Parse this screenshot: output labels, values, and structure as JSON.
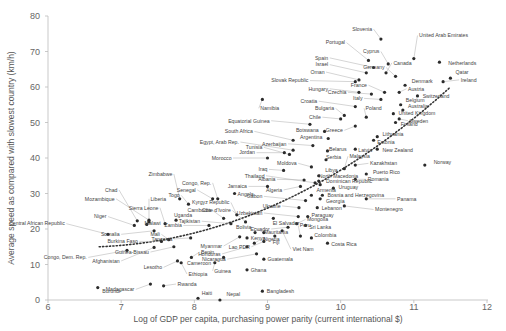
{
  "chart_data": {
    "type": "scatter",
    "title": "",
    "xlabel": "Log of GDP per capita, purchasing power parity (current international $)",
    "ylabel": "Average speed as compared with slowest country (km/h)",
    "xlim": [
      6,
      12
    ],
    "ylim": [
      0,
      80
    ],
    "xticks": [
      "6",
      "7",
      "8",
      "9",
      "10",
      "11",
      "12"
    ],
    "yticks": [
      "0",
      "10",
      "20",
      "30",
      "40",
      "50",
      "60",
      "70",
      "80"
    ],
    "grid": false,
    "legend": null,
    "trendline": {
      "style": "dotted",
      "points": [
        [
          6.7,
          15
        ],
        [
          9.2,
          23
        ],
        [
          11.5,
          60
        ]
      ]
    },
    "points": [
      {
        "label": "Burundi",
        "x": 6.68,
        "y": 3.5,
        "lx": 6.72,
        "ly": 2.4
      },
      {
        "label": "Central African Republic",
        "x": 6.82,
        "y": 18.5,
        "lx": 6.25,
        "ly": 21.5
      },
      {
        "label": "Congo, Dem. Rep.",
        "x": 7.08,
        "y": 14,
        "lx": 6.55,
        "ly": 12
      },
      {
        "label": "Niger",
        "x": 7.18,
        "y": 21,
        "lx": 6.82,
        "ly": 23.5
      },
      {
        "label": "Chad",
        "x": 7.22,
        "y": 22.3,
        "lx": 6.97,
        "ly": 31
      },
      {
        "label": "Mozambique",
        "x": 7.38,
        "y": 22.5,
        "lx": 6.93,
        "ly": 28.5
      },
      {
        "label": "Liberia",
        "x": 7.38,
        "y": 22,
        "lx": 7.38,
        "ly": 28.5
      },
      {
        "label": "Malawi",
        "x": 7.35,
        "y": 21.3,
        "lx": 7.3,
        "ly": 21.5
      },
      {
        "label": "Somalia",
        "x": 7.45,
        "y": 19.5,
        "lx": 7.0,
        "ly": 18.5
      },
      {
        "label": "Burkina Faso",
        "x": 7.55,
        "y": 16.5,
        "lx": 7.25,
        "ly": 16.5
      },
      {
        "label": "Afghanistan",
        "x": 7.45,
        "y": 14.8,
        "lx": 7.0,
        "ly": 11
      },
      {
        "label": "Madagascar",
        "x": 7.4,
        "y": 4.5,
        "lx": 7.2,
        "ly": 3.0
      },
      {
        "label": "Sierra Leone",
        "x": 7.6,
        "y": 21.5,
        "lx": 7.53,
        "ly": 26
      },
      {
        "label": "Uganda",
        "x": 7.75,
        "y": 22.5,
        "lx": 7.7,
        "ly": 24
      },
      {
        "label": "Zimbabwe",
        "x": 7.8,
        "y": 28.5,
        "lx": 7.72,
        "ly": 35.5
      },
      {
        "label": "Togo",
        "x": 7.92,
        "y": 27,
        "lx": 7.82,
        "ly": 29.5
      },
      {
        "label": "Zambia",
        "x": 8.2,
        "y": 21,
        "lx": 7.85,
        "ly": 21
      },
      {
        "label": "Mali",
        "x": 7.65,
        "y": 17,
        "lx": 7.55,
        "ly": 18.5
      },
      {
        "label": "Tanzania",
        "x": 7.95,
        "y": 17.5,
        "lx": 7.72,
        "ly": 17.2
      },
      {
        "label": "Guinea-Bissau",
        "x": 7.72,
        "y": 15,
        "lx": 7.4,
        "ly": 13.5
      },
      {
        "label": "Lesotho",
        "x": 7.77,
        "y": 11,
        "lx": 7.58,
        "ly": 9.2
      },
      {
        "label": "Ethiopia",
        "x": 7.82,
        "y": 10.5,
        "lx": 7.9,
        "ly": 7.3
      },
      {
        "label": "Benin",
        "x": 7.96,
        "y": 12,
        "lx": 8.07,
        "ly": 13.5
      },
      {
        "label": "Rwanda",
        "x": 7.58,
        "y": 4,
        "lx": 7.75,
        "ly": 4.5
      },
      {
        "label": "Haiti",
        "x": 8.05,
        "y": 0.5,
        "lx": 8.08,
        "ly": 1.8
      },
      {
        "label": "Nepal",
        "x": 8.35,
        "y": 0,
        "lx": 8.42,
        "ly": 1.5
      },
      {
        "label": "Senegal",
        "x": 8.25,
        "y": 28.5,
        "lx": 8.04,
        "ly": 31
      },
      {
        "label": "Congo, Rep.",
        "x": 8.32,
        "y": 28.5,
        "lx": 8.25,
        "ly": 33
      },
      {
        "label": "Cambodia",
        "x": 8.4,
        "y": 23,
        "lx": 8.25,
        "ly": 25.2
      },
      {
        "label": "Tajikistan",
        "x": 8.5,
        "y": 21.5,
        "lx": 8.1,
        "ly": 22.2
      },
      {
        "label": "Cote d'Ivoire",
        "x": 8.7,
        "y": 22,
        "lx": 8.52,
        "ly": 25.2
      },
      {
        "label": "Kyrgyz Republic",
        "x": 8.58,
        "y": 24,
        "lx": 8.5,
        "ly": 27.5
      },
      {
        "label": "Angola",
        "x": 8.55,
        "y": 30,
        "lx": 8.57,
        "ly": 29.8
      },
      {
        "label": "Myanmar",
        "x": 8.62,
        "y": 17.8,
        "lx": 8.4,
        "ly": 15.2
      },
      {
        "label": "Kenya",
        "x": 8.72,
        "y": 17.5,
        "lx": 8.75,
        "ly": 17.5
      },
      {
        "label": "Nigeria",
        "x": 8.82,
        "y": 16,
        "lx": 8.92,
        "ly": 17.2
      },
      {
        "label": "Honduras",
        "x": 8.72,
        "y": 15,
        "lx": 8.38,
        "ly": 13
      },
      {
        "label": "Mauritania",
        "x": 8.83,
        "y": 19,
        "lx": 8.93,
        "ly": 19
      },
      {
        "label": "Cameroon",
        "x": 8.4,
        "y": 12,
        "lx": 8.25,
        "ly": 10.5
      },
      {
        "label": "Guinea",
        "x": 8.28,
        "y": 10.5,
        "lx": 8.25,
        "ly": 8.2
      },
      {
        "label": "Nicaragua",
        "x": 8.85,
        "y": 13,
        "lx": 8.45,
        "ly": 11.5
      },
      {
        "label": "Ghana",
        "x": 8.72,
        "y": 8.5,
        "lx": 8.75,
        "ly": 8.5
      },
      {
        "label": "Bangladesh",
        "x": 8.93,
        "y": 2.5,
        "lx": 8.97,
        "ly": 2.5
      },
      {
        "label": "Namibia",
        "x": 8.93,
        "y": 56.5,
        "lx": 8.88,
        "ly": 54
      },
      {
        "label": "Equatorial Guinea",
        "x": 9.58,
        "y": 49.5,
        "lx": 9.05,
        "ly": 50.5
      },
      {
        "label": "South Africa",
        "x": 9.35,
        "y": 45,
        "lx": 8.82,
        "ly": 47.5
      },
      {
        "label": "Egypt, Arab Rep.",
        "x": 9.35,
        "y": 42.2,
        "lx": 8.63,
        "ly": 44.5
      },
      {
        "label": "Tunisia",
        "x": 9.3,
        "y": 41,
        "lx": 8.95,
        "ly": 43
      },
      {
        "label": "Jordan",
        "x": 9.23,
        "y": 41.5,
        "lx": 8.85,
        "ly": 41.5
      },
      {
        "label": "Morocco",
        "x": 9.0,
        "y": 40,
        "lx": 8.53,
        "ly": 40
      },
      {
        "label": "Iraq",
        "x": 9.22,
        "y": 36.5,
        "lx": 9.02,
        "ly": 36.8
      },
      {
        "label": "Thailand",
        "x": 9.65,
        "y": 33,
        "lx": 8.98,
        "ly": 35
      },
      {
        "label": "Jamaica",
        "x": 9.0,
        "y": 32,
        "lx": 8.74,
        "ly": 32
      },
      {
        "label": "Algeria",
        "x": 9.45,
        "y": 32,
        "lx": 9.22,
        "ly": 31
      },
      {
        "label": "Albania",
        "x": 9.5,
        "y": 33.8,
        "lx": 9.13,
        "ly": 34
      },
      {
        "label": "Gabon",
        "x": 9.52,
        "y": 28,
        "lx": 8.95,
        "ly": 29.2
      },
      {
        "label": "Ukraine",
        "x": 9.43,
        "y": 26,
        "lx": 9.2,
        "ly": 26.5
      },
      {
        "label": "Uzbekistan",
        "x": 9.42,
        "y": 23.5,
        "lx": 8.95,
        "ly": 24.5
      },
      {
        "label": "El Salvador",
        "x": 9.08,
        "y": 23,
        "lx": 9.05,
        "ly": 21.5
      },
      {
        "label": "Ecuador",
        "x": 9.28,
        "y": 20.5,
        "lx": 9.05,
        "ly": 20
      },
      {
        "label": "Bolivia",
        "x": 8.95,
        "y": 19,
        "lx": 8.8,
        "ly": 20.5
      },
      {
        "label": "Lao PDR",
        "x": 8.95,
        "y": 16.5,
        "lx": 8.78,
        "ly": 15
      },
      {
        "label": "Fiji",
        "x": 9.1,
        "y": 18,
        "lx": 9.05,
        "ly": 16.2
      },
      {
        "label": "Guatemala",
        "x": 8.95,
        "y": 11.5,
        "lx": 8.98,
        "ly": 11.5
      },
      {
        "label": "Peru",
        "x": 9.45,
        "y": 18,
        "lx": 9.42,
        "ly": 21
      },
      {
        "label": "Mongolia",
        "x": 9.4,
        "y": 21.5,
        "lx": 9.52,
        "ly": 22.7
      },
      {
        "label": "Sri Lanka",
        "x": 9.52,
        "y": 21,
        "lx": 9.55,
        "ly": 20.5
      },
      {
        "label": "Colombia",
        "x": 9.6,
        "y": 17.5,
        "lx": 9.62,
        "ly": 18.2
      },
      {
        "label": "Viet Nam",
        "x": 9.2,
        "y": 19.5,
        "lx": 9.32,
        "ly": 14.3
      },
      {
        "label": "Costa Rica",
        "x": 9.82,
        "y": 16,
        "lx": 9.85,
        "ly": 15.7
      },
      {
        "label": "Paraguay",
        "x": 9.55,
        "y": 23.5,
        "lx": 9.58,
        "ly": 23.8
      },
      {
        "label": "Lebanon",
        "x": 9.68,
        "y": 26,
        "lx": 9.72,
        "ly": 26
      },
      {
        "label": "Georgia",
        "x": 9.72,
        "y": 28.5,
        "lx": 9.78,
        "ly": 27.8
      },
      {
        "label": "Armenia",
        "x": 9.6,
        "y": 29.5,
        "lx": 9.65,
        "ly": 31
      },
      {
        "label": "Bosnia and Herzegovina",
        "x": 9.75,
        "y": 29.5,
        "lx": 9.8,
        "ly": 29.5
      },
      {
        "label": "Uruguay",
        "x": 9.9,
        "y": 31.5,
        "lx": 9.95,
        "ly": 31.8
      },
      {
        "label": "Dominican Republic",
        "x": 9.72,
        "y": 32.5,
        "lx": 9.78,
        "ly": 33.5
      },
      {
        "label": "North Macedonia",
        "x": 9.7,
        "y": 33.5,
        "lx": 9.68,
        "ly": 34.8
      },
      {
        "label": "Libya",
        "x": 9.7,
        "y": 35,
        "lx": 9.77,
        "ly": 36.5
      },
      {
        "label": "Montenegro",
        "x": 10.05,
        "y": 26.5,
        "lx": 10.45,
        "ly": 25.5
      },
      {
        "label": "Panama",
        "x": 10.35,
        "y": 28.5,
        "lx": 10.75,
        "ly": 28.5
      },
      {
        "label": "Romania",
        "x": 10.2,
        "y": 34,
        "lx": 10.35,
        "ly": 34
      },
      {
        "label": "Puerto Rico",
        "x": 10.35,
        "y": 35.5,
        "lx": 10.42,
        "ly": 36
      },
      {
        "label": "Kazakhstan",
        "x": 10.2,
        "y": 38,
        "lx": 10.38,
        "ly": 38.5
      },
      {
        "label": "Malaysia",
        "x": 10.05,
        "y": 37,
        "lx": 10.1,
        "ly": 40.5
      },
      {
        "label": "Moldova",
        "x": 9.6,
        "y": 37.5,
        "lx": 9.42,
        "ly": 38.5
      },
      {
        "label": "Serbia",
        "x": 9.8,
        "y": 39.5,
        "lx": 9.78,
        "ly": 40.3
      },
      {
        "label": "Belarus",
        "x": 9.82,
        "y": 42,
        "lx": 9.82,
        "ly": 42.5
      },
      {
        "label": "Azerbaijan",
        "x": 9.62,
        "y": 43.5,
        "lx": 9.28,
        "ly": 44
      },
      {
        "label": "Latvia",
        "x": 10.2,
        "y": 42.5,
        "lx": 10.22,
        "ly": 42.3
      },
      {
        "label": "New Zealand",
        "x": 10.5,
        "y": 42.5,
        "lx": 10.55,
        "ly": 42.3
      },
      {
        "label": "Argentina",
        "x": 9.83,
        "y": 45.5,
        "lx": 9.77,
        "ly": 45.8
      },
      {
        "label": "Botswana",
        "x": 9.78,
        "y": 47.5,
        "lx": 9.72,
        "ly": 47.8
      },
      {
        "label": "Chile",
        "x": 10.0,
        "y": 51,
        "lx": 9.75,
        "ly": 51.5
      },
      {
        "label": "Greece",
        "x": 10.2,
        "y": 49,
        "lx": 10.05,
        "ly": 47.8
      },
      {
        "label": "Bulgaria",
        "x": 10.05,
        "y": 52,
        "lx": 9.93,
        "ly": 54
      },
      {
        "label": "Croatia",
        "x": 10.2,
        "y": 54.5,
        "lx": 9.7,
        "ly": 56
      },
      {
        "label": "Poland",
        "x": 10.35,
        "y": 51.5,
        "lx": 10.32,
        "ly": 54
      },
      {
        "label": "Lithuania",
        "x": 10.5,
        "y": 46,
        "lx": 10.55,
        "ly": 46.8
      },
      {
        "label": "Estonia",
        "x": 10.45,
        "y": 45,
        "lx": 10.48,
        "ly": 44.5
      },
      {
        "label": "Finland",
        "x": 10.75,
        "y": 50,
        "lx": 10.8,
        "ly": 49.5
      },
      {
        "label": "Sweden",
        "x": 10.8,
        "y": 51,
        "lx": 10.92,
        "ly": 50.5
      },
      {
        "label": "United Kingdom",
        "x": 10.72,
        "y": 52.5,
        "lx": 10.77,
        "ly": 52.7
      },
      {
        "label": "Australia",
        "x": 10.85,
        "y": 53.5,
        "lx": 10.9,
        "ly": 54.5
      },
      {
        "label": "Belgium",
        "x": 10.82,
        "y": 55,
        "lx": 10.87,
        "ly": 56.2
      },
      {
        "label": "Italy",
        "x": 10.55,
        "y": 56.5,
        "lx": 10.32,
        "ly": 56.8
      },
      {
        "label": "Czechia",
        "x": 10.42,
        "y": 58,
        "lx": 10.1,
        "ly": 58.5
      },
      {
        "label": "Hungary",
        "x": 10.25,
        "y": 58.5,
        "lx": 9.85,
        "ly": 59.5
      },
      {
        "label": "Slovak Republic",
        "x": 10.2,
        "y": 61.5,
        "lx": 9.58,
        "ly": 61.8
      },
      {
        "label": "France",
        "x": 10.6,
        "y": 58.5,
        "lx": 10.38,
        "ly": 60.5
      },
      {
        "label": "Austria",
        "x": 10.8,
        "y": 58.5,
        "lx": 10.9,
        "ly": 59.5
      },
      {
        "label": "Switzerland",
        "x": 11.05,
        "y": 57.5,
        "lx": 11.1,
        "ly": 57.5
      },
      {
        "label": "Denmark",
        "x": 10.88,
        "y": 60.5,
        "lx": 10.95,
        "ly": 61.5
      },
      {
        "label": "Germany",
        "x": 10.75,
        "y": 63,
        "lx": 10.62,
        "ly": 65.5
      },
      {
        "label": "Oman",
        "x": 10.25,
        "y": 62,
        "lx": 9.8,
        "ly": 64.2
      },
      {
        "label": "Israel",
        "x": 10.35,
        "y": 64,
        "lx": 9.85,
        "ly": 66.3
      },
      {
        "label": "Spain",
        "x": 10.45,
        "y": 65.5,
        "lx": 9.85,
        "ly": 68.2
      },
      {
        "label": "Portugal",
        "x": 10.38,
        "y": 67.5,
        "lx": 10.08,
        "ly": 72.5
      },
      {
        "label": "Cyprus",
        "x": 10.65,
        "y": 66.5,
        "lx": 10.55,
        "ly": 70
      },
      {
        "label": "Canada",
        "x": 10.62,
        "y": 64,
        "lx": 10.7,
        "ly": 66.8
      },
      {
        "label": "Slovenia",
        "x": 10.55,
        "y": 73.5,
        "lx": 10.45,
        "ly": 76.3
      },
      {
        "label": "United Arab Emirates",
        "x": 11.0,
        "y": 68,
        "lx": 11.05,
        "ly": 74.5
      },
      {
        "label": "Netherlands",
        "x": 11.35,
        "y": 67,
        "lx": 11.45,
        "ly": 66.8
      },
      {
        "label": "Qatar",
        "x": 11.5,
        "y": 62.5,
        "lx": 11.55,
        "ly": 64.2
      },
      {
        "label": "Ireland",
        "x": 11.4,
        "y": 61.5,
        "lx": 11.62,
        "ly": 62
      },
      {
        "label": "Norway",
        "x": 11.15,
        "y": 38,
        "lx": 11.25,
        "ly": 38.8
      }
    ]
  }
}
